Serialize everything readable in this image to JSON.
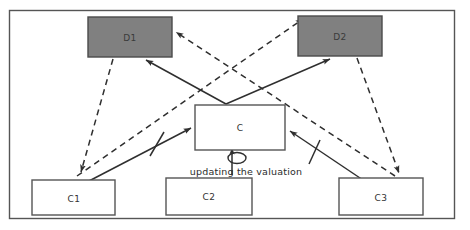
{
  "diagram": {
    "canvas": {
      "width": 470,
      "height": 230
    },
    "frame": {
      "name": "outer-frame",
      "x": 9,
      "y": 10,
      "width": 446,
      "height": 209,
      "stroke": "#555555",
      "fill": "#ffffff"
    },
    "colors": {
      "gray_fill": "#808080",
      "gray_stroke": "#4a4a4a",
      "white_fill": "#ffffff",
      "node_stroke": "#555555",
      "edge_solid": "#2f2f2f",
      "edge_dashed": "#2f2f2f",
      "text": "#333333",
      "background": "#ffffff"
    },
    "nodes": [
      {
        "id": "D1",
        "label": "D1",
        "style": "filled-gray",
        "x": 88,
        "y": 17,
        "width": 84,
        "height": 40
      },
      {
        "id": "D2",
        "label": "D2",
        "style": "filled-gray",
        "x": 298,
        "y": 16,
        "width": 84,
        "height": 40
      },
      {
        "id": "C",
        "label": "C",
        "style": "outline-white",
        "x": 195,
        "y": 105,
        "width": 90,
        "height": 45
      },
      {
        "id": "C1",
        "label": "C1",
        "style": "outline-white",
        "x": 32,
        "y": 180,
        "width": 83,
        "height": 35
      },
      {
        "id": "C2",
        "label": "C2",
        "style": "outline-white",
        "x": 166,
        "y": 178,
        "width": 86,
        "height": 37
      },
      {
        "id": "C3",
        "label": "C3",
        "style": "outline-white",
        "x": 339,
        "y": 178,
        "width": 84,
        "height": 37
      }
    ],
    "edges": [
      {
        "id": "e1",
        "from": "C",
        "to": "D1",
        "style": "solid",
        "marker": "arrow",
        "tick": false
      },
      {
        "id": "e2",
        "from": "C",
        "to": "D2",
        "style": "solid",
        "marker": "arrow",
        "tick": false
      },
      {
        "id": "e3",
        "from": "C1",
        "to": "C",
        "style": "solid",
        "marker": "arrow",
        "tick": true
      },
      {
        "id": "e4",
        "from": "C3",
        "to": "C",
        "style": "solid",
        "marker": "arrow",
        "tick": true
      },
      {
        "id": "e5",
        "from": "D1",
        "to": "C1",
        "style": "dashed",
        "marker": "arrow",
        "tick": false
      },
      {
        "id": "e6",
        "from": "C1",
        "to": "D2",
        "style": "dashed",
        "marker": "arrow",
        "tick": false
      },
      {
        "id": "e7",
        "from": "C3",
        "to": "D1",
        "style": "dashed",
        "marker": "arrow",
        "tick": false
      },
      {
        "id": "e8",
        "from": "D2",
        "to": "C3",
        "style": "dashed",
        "marker": "arrow",
        "tick": false
      },
      {
        "id": "e9",
        "from": "C",
        "to": "C",
        "style": "self-loop",
        "marker": "arrow",
        "tick": false,
        "label": "updating the valuation"
      }
    ],
    "edge_labels": [
      {
        "id": "label-updating",
        "text": "updating the valuation",
        "x": 246,
        "y": 172
      }
    ]
  }
}
